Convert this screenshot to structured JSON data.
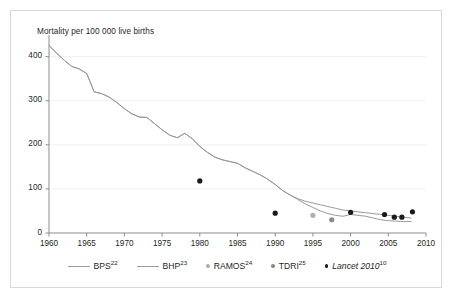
{
  "figure": {
    "y_axis_title": "Mortality per 100 000 live births"
  },
  "legend": {
    "items": [
      {
        "label": "BPS",
        "ref": "22",
        "marker": "line",
        "color": "#9a9a9a",
        "italic": false,
        "name": "legend-item-bps"
      },
      {
        "label": "BHP",
        "ref": "23",
        "marker": "line",
        "color": "#9a9a9a",
        "italic": false,
        "name": "legend-item-bhp"
      },
      {
        "label": "RAMOS",
        "ref": "24",
        "marker": "dot",
        "color": "#b0b0b0",
        "italic": false,
        "name": "legend-item-ramos"
      },
      {
        "label": "TDRI",
        "ref": "25",
        "marker": "dot",
        "color": "#8c8c8c",
        "italic": false,
        "name": "legend-item-tdri"
      },
      {
        "label": "Lancet 2010",
        "ref": "10",
        "marker": "dot",
        "color": "#1a1a1a",
        "italic": true,
        "name": "legend-item-lancet-2010"
      }
    ]
  },
  "chart_data": {
    "type": "line",
    "title": "",
    "subtitle": "",
    "xlabel": "",
    "ylabel": "Mortality per 100 000 live births",
    "xlim": [
      1960,
      2010
    ],
    "ylim": [
      0,
      440
    ],
    "yticks": [
      0,
      100,
      200,
      300,
      400
    ],
    "xticks": [
      1960,
      1965,
      1970,
      1975,
      1980,
      1985,
      1990,
      1995,
      2000,
      2005,
      2010
    ],
    "grid": "horizontal-light",
    "legend_position": "below-axes",
    "series": [
      {
        "name": "BPS",
        "ref": "22",
        "type": "line",
        "color": "#9a9a9a",
        "x": [
          1960,
          1961,
          1962,
          1963,
          1964,
          1965,
          1966,
          1967,
          1968,
          1969,
          1970,
          1971,
          1972,
          1973,
          1974,
          1975,
          1976,
          1977,
          1978,
          1979,
          1980,
          1981,
          1982,
          1983,
          1984,
          1985,
          1986,
          1987,
          1988,
          1989,
          1990,
          1991,
          1992,
          1993,
          1994,
          1995,
          1996,
          1997,
          1998,
          1999,
          2000,
          2001,
          2002,
          2003,
          2004,
          2005,
          2006,
          2007,
          2008
        ],
        "y": [
          425,
          408,
          392,
          378,
          372,
          362,
          320,
          316,
          308,
          296,
          282,
          270,
          263,
          262,
          248,
          234,
          222,
          216,
          226,
          214,
          196,
          183,
          172,
          166,
          162,
          158,
          148,
          140,
          132,
          122,
          110,
          96,
          86,
          78,
          72,
          68,
          64,
          60,
          56,
          52,
          50,
          48,
          46,
          44,
          42,
          40,
          38,
          36,
          34
        ]
      },
      {
        "name": "BHP",
        "ref": "23",
        "type": "line",
        "color": "#9a9a9a",
        "x": [
          1960,
          1961,
          1962,
          1963,
          1964,
          1965,
          1966,
          1967,
          1968,
          1969,
          1970,
          1971,
          1972,
          1973,
          1974,
          1975,
          1976,
          1977,
          1978,
          1979,
          1980,
          1981,
          1982,
          1983,
          1984,
          1985,
          1986,
          1987,
          1988,
          1989,
          1990,
          1991,
          1992,
          1993,
          1994,
          1995,
          1996,
          1997,
          1998,
          1999,
          2000,
          2001,
          2002,
          2003,
          2004,
          2005,
          2006,
          2007,
          2008
        ],
        "y": [
          425,
          408,
          392,
          378,
          372,
          362,
          320,
          316,
          308,
          296,
          282,
          270,
          263,
          262,
          248,
          234,
          222,
          216,
          226,
          214,
          196,
          183,
          172,
          166,
          162,
          158,
          148,
          140,
          132,
          122,
          110,
          96,
          86,
          76,
          66,
          58,
          50,
          44,
          40,
          38,
          42,
          40,
          38,
          34,
          30,
          28,
          27,
          26,
          26
        ]
      },
      {
        "name": "RAMOS",
        "ref": "24",
        "type": "scatter",
        "color": "#b0b0b0",
        "points": [
          {
            "x": 1995,
            "y": 40
          }
        ]
      },
      {
        "name": "TDRI",
        "ref": "25",
        "type": "scatter",
        "color": "#8c8c8c",
        "points": [
          {
            "x": 1997.5,
            "y": 30
          }
        ]
      },
      {
        "name": "Lancet 2010",
        "ref": "10",
        "type": "scatter",
        "color": "#1a1a1a",
        "italic": true,
        "points": [
          {
            "x": 1980,
            "y": 118
          },
          {
            "x": 1990,
            "y": 45
          },
          {
            "x": 2000,
            "y": 47
          },
          {
            "x": 2004.5,
            "y": 42
          },
          {
            "x": 2005.8,
            "y": 36
          },
          {
            "x": 2006.8,
            "y": 36
          },
          {
            "x": 2008.2,
            "y": 48
          }
        ]
      }
    ]
  }
}
